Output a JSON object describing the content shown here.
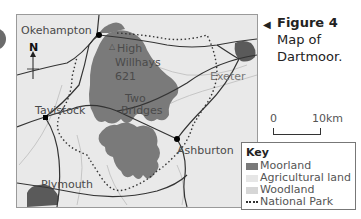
{
  "figure": {
    "arrow_glyph": "◀",
    "title": "Figure 4",
    "caption_line1": "Map of",
    "caption_line2": "Dartmoor."
  },
  "map": {
    "north_label": "N",
    "places": {
      "okehampton": "Okehampton",
      "high_willhays_1": "High",
      "high_willhays_2": "Willhays",
      "high_willhays_height": "621",
      "exeter": "Exeter",
      "tavistock": "Tavistock",
      "two_bridges_1": "Two",
      "two_bridges_2": "Bridges",
      "ashburton": "Ashburton",
      "plymouth": "Plymouth"
    },
    "summit_marker": "△"
  },
  "scale": {
    "start": "0",
    "end": "10km"
  },
  "key": {
    "title": "Key",
    "items": [
      {
        "label": "Moorland",
        "color": "#7a7a7a"
      },
      {
        "label": "Agricultural land",
        "color": "#e6e6e6"
      },
      {
        "label": "Woodland",
        "color": "#d6d6d6"
      },
      {
        "label": "National Park",
        "style": "dotted"
      }
    ]
  },
  "colors": {
    "moorland": "#7a7a7a",
    "urban": "#5a5a5a",
    "background": "#e9e9e9",
    "roads": "#333333"
  }
}
